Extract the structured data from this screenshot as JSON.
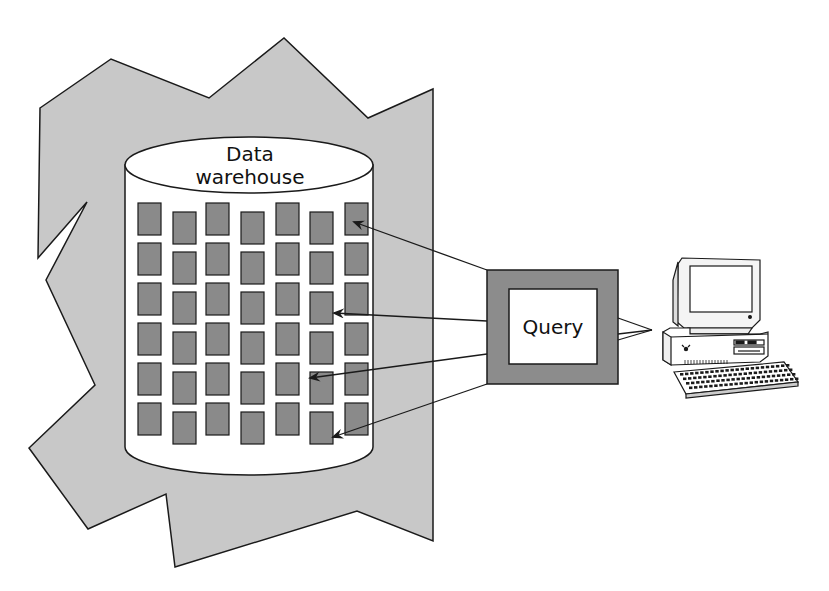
{
  "diagram": {
    "type": "data-warehouse-query",
    "colors": {
      "background": "#ffffff",
      "region_fill": "#c8c8c8",
      "cell_fill": "#8a8a8a",
      "query_frame_fill": "#8c8c8c",
      "stroke": "#1a1a1a",
      "cylinder_fill": "#ffffff"
    },
    "warehouse": {
      "label_line1": "Data",
      "label_line2": "warehouse",
      "grid": {
        "columns": 7,
        "rows": 6
      }
    },
    "query": {
      "label": "Query"
    },
    "client": {
      "icon": "desktop-computer-icon"
    },
    "arrows": [
      {
        "from": "query",
        "to": "cell-r1-c7"
      },
      {
        "from": "query",
        "to": "cell-r3-c6"
      },
      {
        "from": "query",
        "to": "cell-r5-c6"
      },
      {
        "from": "query",
        "to": "cell-r6-c6"
      }
    ]
  }
}
